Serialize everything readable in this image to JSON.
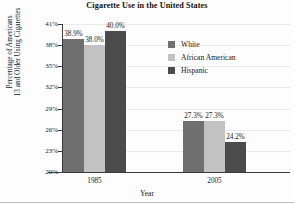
{
  "chart_data": {
    "type": "bar",
    "title": "Cigarette Use in the United States",
    "xlabel": "Year",
    "ylabel_line1": "Percentage of Americans",
    "ylabel_line2": "13 and Older Using Cigarettes",
    "categories": [
      "1985",
      "2005"
    ],
    "series": [
      {
        "name": "White",
        "color": "#6f6f6f",
        "values": [
          38.9,
          27.3
        ],
        "labels": [
          "38.9%",
          "27.3%"
        ]
      },
      {
        "name": "African American",
        "color": "#c2c2c2",
        "values": [
          38.0,
          27.3
        ],
        "labels": [
          "38.0%",
          "27.3%"
        ]
      },
      {
        "name": "Hispanic",
        "color": "#4b4b4b",
        "values": [
          40.0,
          24.2
        ],
        "labels": [
          "40.0%",
          "24.2%"
        ]
      }
    ],
    "ylim": [
      20,
      41
    ],
    "yticks": [
      "20%",
      "23%",
      "26%",
      "29%",
      "32%",
      "35%",
      "38%",
      "41%"
    ],
    "ytick_values": [
      20,
      23,
      26,
      29,
      32,
      35,
      38,
      41
    ],
    "grid": true,
    "legend_position": "inside-upper-right"
  },
  "legend": {
    "items": [
      {
        "label": "White"
      },
      {
        "label": "African American"
      },
      {
        "label": "Hispanic"
      }
    ]
  }
}
